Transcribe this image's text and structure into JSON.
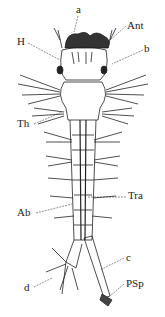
{
  "figure": {
    "colors": {
      "ink": "#222222",
      "background": "#ffffff",
      "dark_fill": "#333333"
    },
    "labels": [
      {
        "id": "a",
        "text": "a",
        "x": 76,
        "y": 4
      },
      {
        "id": "ant",
        "text": "Ant",
        "x": 127,
        "y": 23
      },
      {
        "id": "h",
        "text": "H",
        "x": 17,
        "y": 39
      },
      {
        "id": "b",
        "text": "b",
        "x": 144,
        "y": 46
      },
      {
        "id": "th",
        "text": "Th",
        "x": 17,
        "y": 120
      },
      {
        "id": "tra",
        "text": "Tra",
        "x": 128,
        "y": 193
      },
      {
        "id": "ab",
        "text": "Ab",
        "x": 17,
        "y": 209
      },
      {
        "id": "c",
        "text": "c",
        "x": 126,
        "y": 255
      },
      {
        "id": "d",
        "text": "d",
        "x": 24,
        "y": 284
      },
      {
        "id": "psp",
        "text": "PSp",
        "x": 126,
        "y": 280
      }
    ]
  }
}
